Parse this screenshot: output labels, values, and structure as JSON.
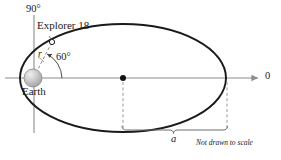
{
  "figure": {
    "type": "orbital-diagram",
    "labels": {
      "angle_vertical": "90°",
      "satellite_name": "Explorer 18",
      "radius_symbol": "r",
      "angle_orbit": "60°",
      "body_name": "Earth",
      "angle_reference": "0",
      "semi_major_axis": "a",
      "scale_note": "Not drawn to scale"
    },
    "colors": {
      "orbit_stroke": "#1a1a1a",
      "axis_stroke": "#8c8c8c",
      "dashed_stroke": "#9a9a9a",
      "earth_fill": "#b8b8b8",
      "earth_highlight": "#e8e8e8",
      "text": "#1a1a1a",
      "background": "#ffffff"
    },
    "geometry": {
      "orbit_center_x": 123,
      "orbit_center_y": 78,
      "orbit_rx": 103,
      "orbit_ry": 54,
      "earth_focus_x": 33,
      "earth_focus_y": 78,
      "earth_radius": 9,
      "satellite_x": 52,
      "satellite_y": 42,
      "vertical_axis_x": 34,
      "axis_arrow_end_x": 258,
      "bracket_left_x": 122,
      "bracket_right_x": 228,
      "bracket_y": 130
    }
  }
}
